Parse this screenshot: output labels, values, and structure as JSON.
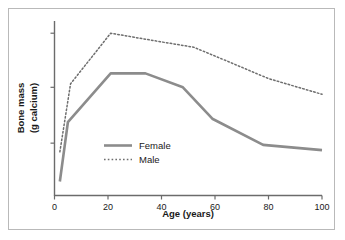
{
  "chart_data": {
    "type": "line",
    "title": "",
    "subtitle": "",
    "xlabel": "Age (years)",
    "ylabel": "Bone mass\n(g calcium)",
    "ylabel_line1": "Bone mass",
    "ylabel_line2": "(g calcium)",
    "xlim": [
      0,
      100
    ],
    "ylim": [
      0,
      100
    ],
    "xticks": [
      0,
      20,
      40,
      60,
      80,
      100
    ],
    "xtick_labels": [
      "0",
      "20",
      "40",
      "60",
      "80",
      "100"
    ],
    "yticks": [
      30,
      62,
      93
    ],
    "ytick_labels": [
      "",
      "",
      ""
    ],
    "grid": false,
    "legend_position": "inside-lower-left",
    "series": [
      {
        "name": "Female",
        "label": "Female",
        "style": "solid",
        "color": "#8c8c8c",
        "x": [
          2,
          5,
          21,
          34,
          48,
          59,
          78,
          100
        ],
        "values": [
          8,
          42,
          70,
          70,
          62,
          44,
          29,
          26
        ]
      },
      {
        "name": "Male",
        "label": "Male",
        "style": "dotted",
        "color": "#6e6e6e",
        "x": [
          2,
          6,
          21,
          40,
          52,
          63,
          80,
          100
        ],
        "values": [
          25,
          64,
          93,
          88,
          85,
          78,
          67,
          58
        ]
      }
    ],
    "colors": {
      "female_line": "#8c8c8c",
      "male_line": "#6e6e6e",
      "axis": "#6b6b6b",
      "text": "#1a1a1a",
      "frame_border": "#b9b9b9",
      "background": "#ffffff"
    }
  },
  "legend": {
    "items": [
      {
        "label": "Female",
        "style": "solid"
      },
      {
        "label": "Male",
        "style": "dotted"
      }
    ]
  },
  "axes": {
    "x_title": "Age (years)",
    "y_title_line1": "Bone mass",
    "y_title_line2": "(g calcium)"
  }
}
